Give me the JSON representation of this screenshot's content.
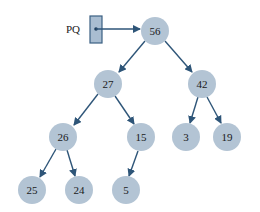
{
  "diagram": {
    "pointer": {
      "label": "PQ",
      "target": "56"
    },
    "colors": {
      "node_fill": "#b3c4d4",
      "edge": "#2e5578",
      "pointer_box": "#a9bdd1"
    },
    "nodes": [
      {
        "id": "n56",
        "label": "56",
        "x": 155,
        "y": 31
      },
      {
        "id": "n27",
        "label": "27",
        "x": 108,
        "y": 84
      },
      {
        "id": "n42",
        "label": "42",
        "x": 202,
        "y": 84
      },
      {
        "id": "n26",
        "label": "26",
        "x": 63,
        "y": 137
      },
      {
        "id": "n15",
        "label": "15",
        "x": 141,
        "y": 137
      },
      {
        "id": "n3",
        "label": "3",
        "x": 186,
        "y": 137
      },
      {
        "id": "n19",
        "label": "19",
        "x": 227,
        "y": 137
      },
      {
        "id": "n25",
        "label": "25",
        "x": 32,
        "y": 190
      },
      {
        "id": "n24",
        "label": "24",
        "x": 79,
        "y": 190
      },
      {
        "id": "n5",
        "label": "5",
        "x": 126,
        "y": 190
      }
    ],
    "edges": [
      {
        "from": "56",
        "to": "27"
      },
      {
        "from": "56",
        "to": "42"
      },
      {
        "from": "27",
        "to": "26"
      },
      {
        "from": "27",
        "to": "15"
      },
      {
        "from": "42",
        "to": "3"
      },
      {
        "from": "42",
        "to": "19"
      },
      {
        "from": "26",
        "to": "25"
      },
      {
        "from": "26",
        "to": "24"
      },
      {
        "from": "15",
        "to": "5"
      }
    ]
  }
}
